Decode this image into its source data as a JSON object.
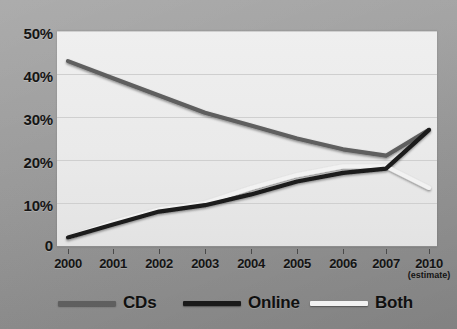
{
  "chart_data": {
    "type": "line",
    "title": "",
    "subtitle": "",
    "xlabel": "",
    "ylabel": "",
    "x": [
      "2000",
      "2001",
      "2002",
      "2003",
      "2004",
      "2005",
      "2006",
      "2007",
      "2010"
    ],
    "x_tick_labels": [
      "2000",
      "2001",
      "2002",
      "2003",
      "2004",
      "2005",
      "2006",
      "2007",
      "2010"
    ],
    "x_tick_sublabels": [
      "",
      "",
      "",
      "",
      "",
      "",
      "",
      "",
      "(estimate)"
    ],
    "y_tick_labels": [
      "50%",
      "40%",
      "30%",
      "20%",
      "10%",
      "0"
    ],
    "y_tick_values": [
      50,
      40,
      30,
      20,
      10,
      0
    ],
    "ylim": [
      0,
      50
    ],
    "grid": true,
    "legend_position": "bottom",
    "series": [
      {
        "name": "CDs",
        "color": "#5f5f5f",
        "values": [
          43,
          39,
          35,
          31,
          28,
          25,
          22.5,
          21,
          27
        ]
      },
      {
        "name": "Online",
        "color": "#1a1a1a",
        "values": [
          2,
          5,
          8,
          9.5,
          12,
          15,
          17,
          18,
          27
        ]
      },
      {
        "name": "Both",
        "color": "#f2f2f2",
        "values": [
          2,
          5.5,
          8.5,
          10,
          13.5,
          16.5,
          18.5,
          18.5,
          13.5
        ]
      }
    ]
  },
  "legend": {
    "items": [
      {
        "label": "CDs",
        "swatch_color": "#5f5f5f"
      },
      {
        "label": "Online",
        "swatch_color": "#1a1a1a"
      },
      {
        "label": "Both",
        "swatch_color": "#f2f2f2"
      }
    ]
  },
  "colors": {
    "background": "#9a9a9a",
    "plot_background": "#eaeaea",
    "gridline": "#cfcfcf",
    "axis": "#8d8d8d",
    "text": "#141414",
    "cds_line": "#5f5f5f",
    "online_line": "#1a1a1a",
    "both_line": "#f2f2f2"
  }
}
